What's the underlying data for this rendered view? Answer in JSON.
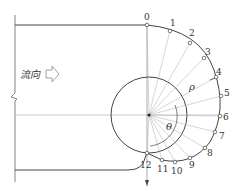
{
  "diagram": {
    "flow_label": "流向",
    "symbols": {
      "radius": "ρ",
      "angle": "θ"
    },
    "points": [
      {
        "label": "0",
        "x": 147,
        "y": 25,
        "lx": 144,
        "ly": 20
      },
      {
        "label": "1",
        "x": 170,
        "y": 31,
        "lx": 170,
        "ly": 26
      },
      {
        "label": "2",
        "x": 190,
        "y": 43,
        "lx": 189,
        "ly": 36
      },
      {
        "label": "3",
        "x": 204,
        "y": 58,
        "lx": 205,
        "ly": 55
      },
      {
        "label": "4",
        "x": 216,
        "y": 77,
        "lx": 216,
        "ly": 75
      },
      {
        "label": "5",
        "x": 221,
        "y": 96,
        "lx": 224,
        "ly": 96
      },
      {
        "label": "6",
        "x": 220,
        "y": 116,
        "lx": 223,
        "ly": 120
      },
      {
        "label": "7",
        "x": 215,
        "y": 132,
        "lx": 219,
        "ly": 139
      },
      {
        "label": "8",
        "x": 205,
        "y": 148,
        "lx": 207,
        "ly": 156
      },
      {
        "label": "9",
        "x": 190,
        "y": 158,
        "lx": 189,
        "ly": 168
      },
      {
        "label": "10",
        "x": 175,
        "y": 162,
        "lx": 171,
        "ly": 174
      },
      {
        "label": "11",
        "x": 162,
        "y": 160,
        "lx": 157,
        "ly": 172
      },
      {
        "label": "12",
        "x": 147,
        "y": 153,
        "lx": 140,
        "ly": 168
      }
    ],
    "colors": {
      "line": "#444444",
      "thin": "#999999",
      "bg": "#ffffff"
    }
  }
}
